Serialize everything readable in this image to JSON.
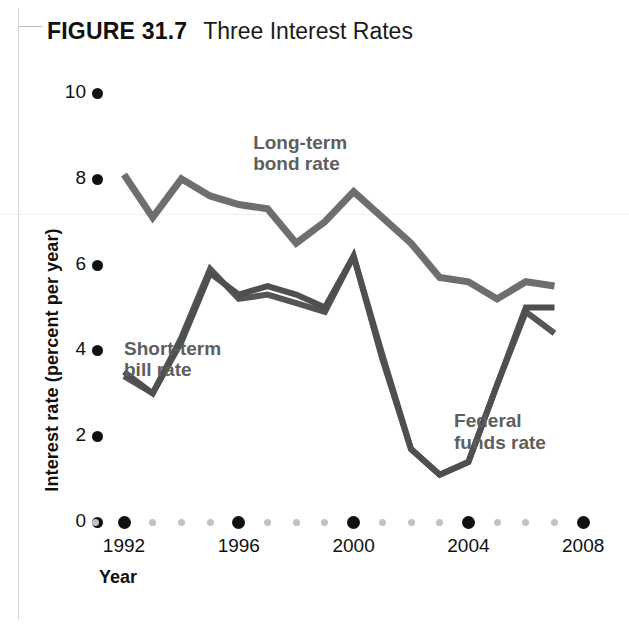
{
  "figure": {
    "number": "FIGURE 31.7",
    "name": "Three Interest Rates"
  },
  "chart_data": {
    "type": "line",
    "xlabel": "Year",
    "ylabel": "Interest rate (percent per year)",
    "xlim": [
      1992,
      2007.5
    ],
    "ylim": [
      0,
      10.4
    ],
    "grid": false,
    "legend": "inline-annotations",
    "x_ticks_major": [
      "1992",
      "1996",
      "2000",
      "2004",
      "2008"
    ],
    "x_ticks_major_values": [
      1992,
      1996,
      2000,
      2004,
      2008
    ],
    "x_ticks_minor_values": [
      1991,
      1993,
      1994,
      1995,
      1997,
      1998,
      1999,
      2001,
      2002,
      2003,
      2005,
      2006,
      2007
    ],
    "y_ticks": [
      "0",
      "2",
      "4",
      "6",
      "8",
      "10"
    ],
    "y_tick_values": [
      0,
      2,
      4,
      6,
      8,
      10
    ],
    "x": [
      1992,
      1993,
      1994,
      1995,
      1996,
      1997,
      1998,
      1999,
      2000,
      2001,
      2002,
      2003,
      2004,
      2005,
      2006,
      2007
    ],
    "series": [
      {
        "name": "Long-term bond rate",
        "color": "#6e6e6e",
        "values": [
          8.1,
          7.1,
          8.0,
          7.6,
          7.4,
          7.3,
          6.5,
          7.0,
          7.7,
          7.1,
          6.5,
          5.7,
          5.6,
          5.2,
          5.6,
          5.5
        ],
        "label_x": 2000.6,
        "label_y": 9.1
      },
      {
        "name": "Short-term bill rate",
        "color": "#555555",
        "values": [
          3.4,
          3.0,
          4.3,
          5.9,
          5.2,
          5.3,
          5.1,
          4.9,
          6.2,
          3.9,
          1.7,
          1.1,
          1.4,
          3.2,
          4.9,
          4.4
        ],
        "label_x": 1996.3,
        "label_y": 4.3
      },
      {
        "name": "Federal funds rate",
        "color": "#4f4f4f",
        "values": [
          3.5,
          3.0,
          4.2,
          5.8,
          5.3,
          5.5,
          5.3,
          5.0,
          6.2,
          3.8,
          1.7,
          1.1,
          1.4,
          3.2,
          5.0,
          5.0
        ],
        "label_x": 2004.4,
        "label_y": 2.6
      }
    ],
    "annotations": [
      {
        "id": "long-term-bond-rate-label",
        "text": "Long-term\nbond rate"
      },
      {
        "id": "short-term-bill-rate-label",
        "text": "Short-term\nbill rate"
      },
      {
        "id": "federal-funds-rate-label",
        "text": "Federal\nfunds rate"
      }
    ]
  }
}
